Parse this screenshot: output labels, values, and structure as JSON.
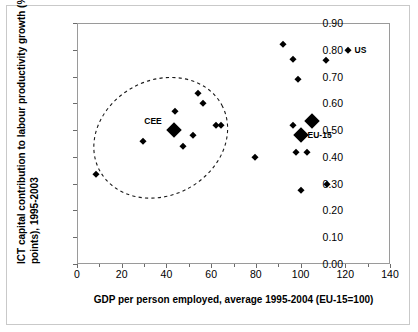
{
  "chart_data": {
    "type": "scatter",
    "title": "",
    "xlabel": "GDP per person employed, average 1995-2004 (EU-15=100)",
    "ylabel": "ICT capital contribution to labour productivity growth (%-points), 1995-2003",
    "xlim": [
      0,
      140
    ],
    "ylim": [
      0.0,
      0.9
    ],
    "xticks": [
      "0",
      "20",
      "40",
      "60",
      "80",
      "100",
      "120",
      "140"
    ],
    "xtick_values": [
      0,
      20,
      40,
      60,
      80,
      100,
      120,
      140
    ],
    "yticks": [
      "0.00",
      "0.10",
      "0.20",
      "0.30",
      "0.40",
      "0.50",
      "0.60",
      "0.70",
      "0.80",
      "0.90"
    ],
    "ytick_values": [
      0.0,
      0.1,
      0.2,
      0.3,
      0.4,
      0.5,
      0.6,
      0.7,
      0.8,
      0.9
    ],
    "grid": false,
    "legend": "none",
    "marker": "diamond",
    "marker_color": "#000000",
    "points": [
      {
        "x": 8.5,
        "y": 0.335,
        "size": "small",
        "label": ""
      },
      {
        "x": 29.5,
        "y": 0.46,
        "size": "small",
        "label": ""
      },
      {
        "x": 43.5,
        "y": 0.5,
        "size": "large",
        "label": "CEE",
        "label_pos": "left"
      },
      {
        "x": 44.0,
        "y": 0.57,
        "size": "small",
        "label": ""
      },
      {
        "x": 47.5,
        "y": 0.44,
        "size": "small",
        "label": ""
      },
      {
        "x": 52.0,
        "y": 0.48,
        "size": "small",
        "label": ""
      },
      {
        "x": 54.0,
        "y": 0.64,
        "size": "small",
        "label": ""
      },
      {
        "x": 56.5,
        "y": 0.6,
        "size": "small",
        "label": ""
      },
      {
        "x": 62.0,
        "y": 0.52,
        "size": "small",
        "label": ""
      },
      {
        "x": 64.5,
        "y": 0.52,
        "size": "small",
        "label": ""
      },
      {
        "x": 79.5,
        "y": 0.4,
        "size": "small",
        "label": ""
      },
      {
        "x": 92.0,
        "y": 0.82,
        "size": "small",
        "label": ""
      },
      {
        "x": 96.5,
        "y": 0.765,
        "size": "small",
        "label": ""
      },
      {
        "x": 99.0,
        "y": 0.69,
        "size": "small",
        "label": ""
      },
      {
        "x": 100.0,
        "y": 0.48,
        "size": "large",
        "label": "EU-15",
        "label_pos": "right"
      },
      {
        "x": 96.5,
        "y": 0.52,
        "size": "small",
        "label": ""
      },
      {
        "x": 105.0,
        "y": 0.535,
        "size": "large",
        "label": ""
      },
      {
        "x": 98.0,
        "y": 0.42,
        "size": "small",
        "label": ""
      },
      {
        "x": 103.0,
        "y": 0.42,
        "size": "small",
        "label": ""
      },
      {
        "x": 100.0,
        "y": 0.275,
        "size": "small",
        "label": ""
      },
      {
        "x": 112.0,
        "y": 0.3,
        "size": "small",
        "label": ""
      },
      {
        "x": 111.5,
        "y": 0.76,
        "size": "small",
        "label": ""
      },
      {
        "x": 121.0,
        "y": 0.8,
        "size": "small",
        "label": "US",
        "label_pos": "right"
      }
    ],
    "annotations": [
      {
        "type": "dashed-ellipse",
        "label": "CEE cluster",
        "cx": 37.0,
        "cy": 0.475,
        "rx": 31.0,
        "ry": 0.215,
        "rotation_deg": -28
      }
    ]
  },
  "axis": {
    "y_title_line1": "ICT capital contribution to labour productivity growth (%-",
    "y_title_line2": "points), 1995-2003"
  }
}
